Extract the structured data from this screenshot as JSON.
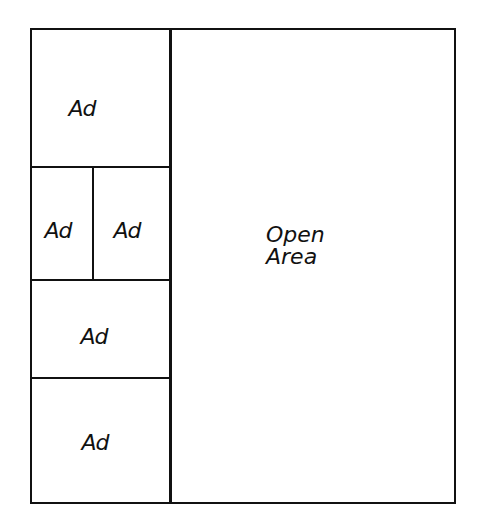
{
  "diagram": {
    "type": "page-layout-sketch",
    "left_column": {
      "blocks": [
        {
          "label": "Ad"
        },
        {
          "label": "Ad"
        },
        {
          "label": "Ad"
        },
        {
          "label": "Ad"
        },
        {
          "label": "Ad"
        }
      ]
    },
    "open_area": {
      "line1": "Open",
      "line2": "Area"
    },
    "stroke_color": "#111111",
    "background_color": "#ffffff"
  }
}
